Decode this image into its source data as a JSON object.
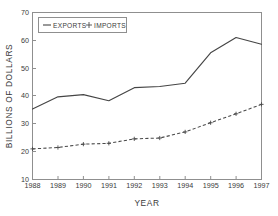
{
  "chart_data": {
    "type": "line",
    "title": "",
    "xlabel": "YEAR",
    "ylabel": "BILLIONS OF DOLLARS",
    "categories": [
      1988,
      1989,
      1990,
      1991,
      1992,
      1993,
      1994,
      1995,
      1996,
      1997
    ],
    "xtick_labels": [
      "1988",
      "1989",
      "1990",
      "1991",
      "1992",
      "1993",
      "1994",
      "1995",
      "1996",
      "1997"
    ],
    "ytick_labels": [
      "10",
      "20",
      "30",
      "40",
      "50",
      "60",
      "70"
    ],
    "yticks": [
      10,
      20,
      30,
      40,
      50,
      60,
      70
    ],
    "xlim": [
      1988,
      1997
    ],
    "ylim": [
      10,
      70
    ],
    "grid": false,
    "legend_position": "upper-left",
    "series": [
      {
        "name": "EXPORTS",
        "marker": "dash",
        "linestyle": "solid",
        "color": "#454545",
        "values": [
          35.3,
          39.7,
          40.5,
          38.3,
          43.0,
          43.4,
          44.6,
          55.5,
          61.0,
          58.6
        ]
      },
      {
        "name": "IMPORTS",
        "marker": "plus",
        "linestyle": "dashed",
        "color": "#4a4a4a",
        "values": [
          21.0,
          21.5,
          22.7,
          23.0,
          24.6,
          24.9,
          27.1,
          30.4,
          33.6,
          37.0
        ]
      }
    ]
  },
  "legend": {
    "entries": [
      {
        "label": "EXPORTS"
      },
      {
        "label": "IMPORTS"
      }
    ]
  },
  "axes": {
    "x_title": "YEAR",
    "y_title": "BILLIONS OF DOLLARS"
  }
}
